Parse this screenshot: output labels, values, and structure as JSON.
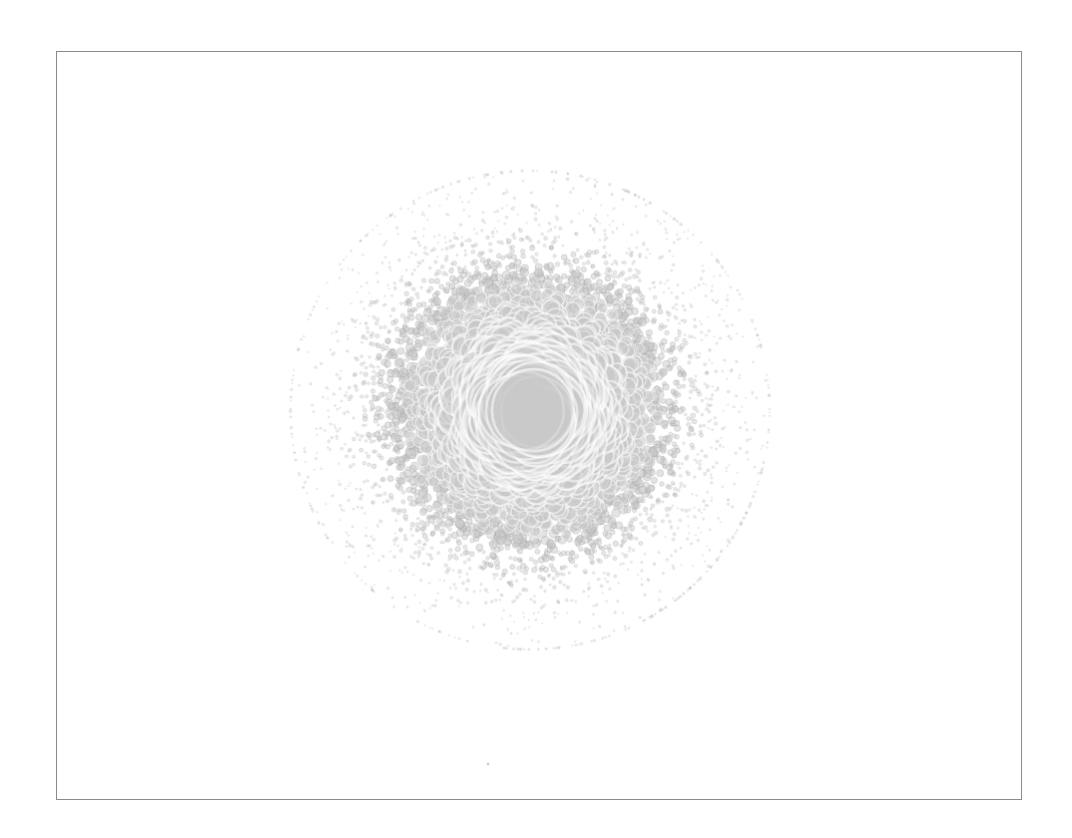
{
  "figure": {
    "background_color": "#ffffff",
    "width": 1072,
    "height": 838
  },
  "plot_frame": {
    "left": 56,
    "top": 51,
    "width": 966,
    "height": 749,
    "border_color": "#8a8a8a",
    "border_width": 1,
    "facecolor": "#ffffff"
  },
  "chart_data": {
    "type": "scatter",
    "title": "",
    "subtitle": "",
    "xlabel": "",
    "ylabel": "",
    "xlim": [
      -1,
      1
    ],
    "ylim": [
      -1,
      1
    ],
    "grid": false,
    "legend": null,
    "xticks": [],
    "yticks": [],
    "xticklabels": [],
    "yticklabels": [],
    "annotations": [],
    "description": "Radial bubble scatter: a single dense circular cloud of points centered in the axes. Marker area decreases with radial distance from the centre, so a few very large overlapping circles form the core while thousands of tiny dots fade out toward the periphery.",
    "series": [
      {
        "name": "points",
        "marker": "circle",
        "n_points": 6000,
        "fill_color": "#c9c9c9",
        "edge_color": "#ffffff",
        "small_edge_color": "#9a9a9a",
        "alpha": 0.55,
        "center_x": 0.0,
        "center_y": 0.0,
        "center_px": [
          530,
          410
        ],
        "radial_distribution": "gaussian",
        "radial_sigma_px": 95,
        "max_radius_px": 240,
        "size_min_px": 1.0,
        "size_max_px": 34.0,
        "size_mapping": "marker radius decays with distance from centre"
      }
    ]
  },
  "outliers": [
    {
      "name": "isolated-dot",
      "x_px": 488,
      "y_px": 765,
      "radius_px": 1.2,
      "color": "#b8b8b8"
    }
  ],
  "accessibility": {
    "summary": "Unlabeled scatter plot showing a circular radial point cloud"
  }
}
